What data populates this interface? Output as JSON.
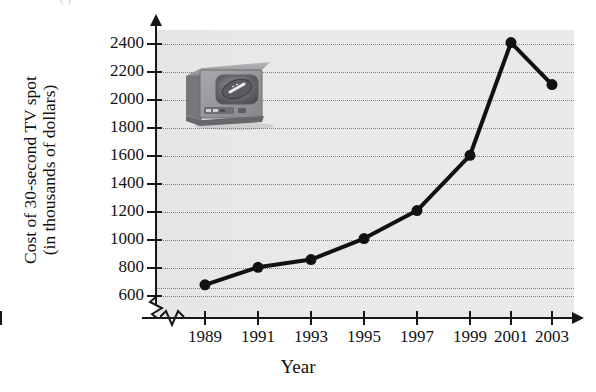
{
  "page": {
    "top_cropped_text": "(                                                                                          )"
  },
  "chart_data": {
    "type": "line",
    "title": "",
    "xlabel": "Year",
    "ylabel": "Cost of 30-second TV spot (in thousands of dollars)",
    "ylabel_line1": "Cost of 30-second TV spot",
    "ylabel_line2": "(in thousands of dollars)",
    "categories": [
      "1989",
      "1991",
      "1993",
      "1995",
      "1997",
      "1999",
      "2001",
      "2003"
    ],
    "values": [
      680,
      805,
      860,
      1010,
      1210,
      1605,
      2410,
      2110
    ],
    "yticks": [
      600,
      800,
      1000,
      1200,
      1400,
      1600,
      1800,
      2000,
      2200,
      2400
    ],
    "ylim": [
      600,
      2400
    ],
    "ytick_step": 200,
    "grid": "horizontal-dotted",
    "legend": "none",
    "axis_break_y": true,
    "axis_break_x": true,
    "series_name": "Cost of 30-second TV spot"
  },
  "style": {
    "plot_background": "#e9e9ea",
    "line_color": "#111114",
    "marker_color": "#111114",
    "axis_color": "#17171a",
    "gridline_color": "#6f6f73",
    "text_color": "#121214"
  },
  "decoration": {
    "clipart_name": "retro-television-with-football-on-screen",
    "clipart_alt": "Illustration of an old television set displaying a football"
  }
}
